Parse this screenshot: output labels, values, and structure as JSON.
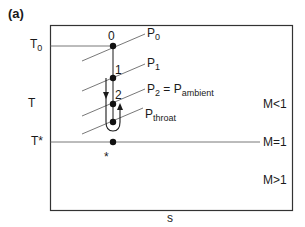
{
  "panel_label": "(a)",
  "axes": {
    "x_label": "s",
    "y_label": "T"
  },
  "levels": {
    "t0": {
      "main": "T",
      "sub": "0"
    },
    "tstar": "T*"
  },
  "points": {
    "p0": "0",
    "p1": "1",
    "p2": "2",
    "star": "*"
  },
  "isobars": {
    "p0": {
      "main": "P",
      "sub": "0"
    },
    "p1": {
      "main": "P",
      "sub": "1"
    },
    "p2": {
      "main": "P",
      "sub": "2",
      "eq": " = P",
      "sub2": "ambient"
    },
    "throat": {
      "main": "P",
      "sub": "throat"
    }
  },
  "regions": {
    "subsonic": "M<1",
    "sonic": "M=1",
    "supersonic": "M>1"
  },
  "colors": {
    "line": "#1a1a1a",
    "frame": "#333333",
    "background": "#ffffff"
  }
}
